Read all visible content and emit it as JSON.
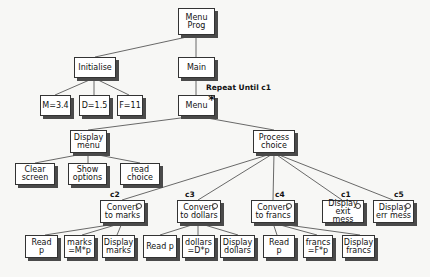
{
  "diagram": {
    "type": "Jackson structure chart",
    "nodes": {
      "root": {
        "label": "Menu\nProg"
      },
      "initialise": {
        "label": "Initialise"
      },
      "main": {
        "label": "Main"
      },
      "m_const": {
        "label": "M=3.4"
      },
      "d_const": {
        "label": "D=1.5"
      },
      "f_const": {
        "label": "F=11"
      },
      "menu": {
        "label": "Menu",
        "marker": "*"
      },
      "display_menu": {
        "label": "Display\nmenu"
      },
      "process_choice": {
        "label": "Process\nchoice"
      },
      "clear_screen": {
        "label": "Clear\nscreen"
      },
      "show_options": {
        "label": "Show\noptions"
      },
      "read_choice": {
        "label": "read\nchoice"
      },
      "convert_marks": {
        "label": "Convert\nto marks",
        "condition": "c2"
      },
      "convert_dollars": {
        "label": "Convert\nto dollars",
        "condition": "c3"
      },
      "convert_francs": {
        "label": "Convert\nto francs",
        "condition": "c4"
      },
      "display_exit": {
        "label": "Display\nexit mess",
        "condition": "c1"
      },
      "display_err": {
        "label": "Display\nerr mess",
        "condition": "c5"
      },
      "marks_read": {
        "label": "Read p"
      },
      "marks_calc": {
        "label": "marks\n=M*p"
      },
      "marks_display": {
        "label": "Display\nmarks"
      },
      "dollars_read": {
        "label": "Read p"
      },
      "dollars_calc": {
        "label": "dollars\n=D*p"
      },
      "dollars_display": {
        "label": "Display\ndollars"
      },
      "francs_read": {
        "label": "Read p"
      },
      "francs_calc": {
        "label": "francs\n=F*p"
      },
      "francs_display": {
        "label": "Display\nfrancs"
      }
    },
    "annotations": {
      "repeat": "Repeat Until c1"
    }
  }
}
